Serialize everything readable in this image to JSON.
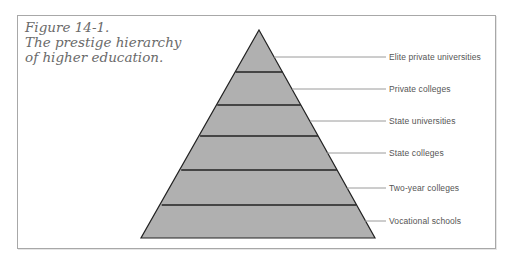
{
  "caption": {
    "line1": "Figure 14-1.",
    "line2": "The prestige hierarchy",
    "line3": "of higher education."
  },
  "pyramid": {
    "fill_color": "#b0b0b0",
    "stroke_color": "#222222",
    "levels": [
      {
        "label": "Elite private universities",
        "rank": 1
      },
      {
        "label": "Private colleges",
        "rank": 2
      },
      {
        "label": "State universities",
        "rank": 3
      },
      {
        "label": "State colleges",
        "rank": 4
      },
      {
        "label": "Two-year colleges",
        "rank": 5
      },
      {
        "label": "Vocational schools",
        "rank": 6
      }
    ]
  }
}
